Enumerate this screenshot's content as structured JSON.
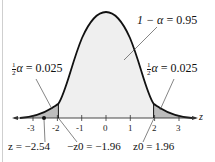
{
  "diagram": {
    "type": "standard normal distribution two-tailed test",
    "axis_label": "z",
    "ticks": [
      "-3",
      "-2",
      "-1",
      "0",
      "1",
      "2",
      "3"
    ],
    "center_label": {
      "lhs": "1 − α",
      "value": "0.95",
      "text": "1 − α = 0.95"
    },
    "left_tail_label": {
      "frac_num": "1",
      "frac_den": "2",
      "symbol": "α",
      "value": "0.025",
      "text": "½α = 0.025"
    },
    "right_tail_label": {
      "frac_num": "1",
      "frac_den": "2",
      "symbol": "α",
      "value": "0.025",
      "text": "½α = 0.025"
    },
    "test_statistic": {
      "text": "z = −2.54",
      "value": "-2.54"
    },
    "left_critical": {
      "text": "−z0 = −1.96",
      "value": "-1.96"
    },
    "right_critical": {
      "text": "z0 = 1.96",
      "value": "1.96"
    },
    "colors": {
      "curve": "#111111",
      "center_fill": "#eeeeee",
      "tail_fill": "#bdbdbd",
      "axis": "#333333"
    }
  }
}
